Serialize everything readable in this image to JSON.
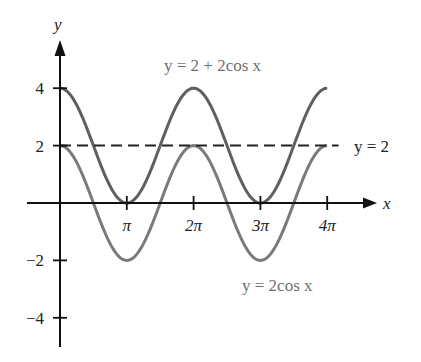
{
  "chart_data": {
    "type": "line",
    "title": "",
    "xlabel": "x",
    "ylabel": "y",
    "xlim": [
      -1.55,
      4.8
    ],
    "ylim": [
      -4.9,
      5.6
    ],
    "x_unit": "pi",
    "x_ticks": [
      {
        "value": 1,
        "label": "π"
      },
      {
        "value": 2,
        "label": "2π"
      },
      {
        "value": 3,
        "label": "3π"
      },
      {
        "value": 4,
        "label": "4π"
      }
    ],
    "y_ticks": [
      {
        "value": 4,
        "label": "4"
      },
      {
        "value": 2,
        "label": "2"
      },
      {
        "value": -2,
        "label": "−2"
      },
      {
        "value": -4,
        "label": "−4"
      }
    ],
    "grid": false,
    "series": [
      {
        "name": "y = 2 + 2cos x",
        "formula": "2 + 2cos(x)",
        "style": "solid",
        "color": "#5f5f5f",
        "domain_pi": [
          0,
          4
        ],
        "x_pi": [
          0,
          0.5,
          1,
          1.5,
          2,
          2.5,
          3,
          3.5,
          4
        ],
        "values": [
          4,
          2,
          0,
          2,
          4,
          2,
          0,
          2,
          4
        ]
      },
      {
        "name": "y = 2cos x",
        "formula": "2cos(x)",
        "style": "solid",
        "color": "#7a7a7a",
        "domain_pi": [
          0,
          4
        ],
        "x_pi": [
          0,
          0.5,
          1,
          1.5,
          2,
          2.5,
          3,
          3.5,
          4
        ],
        "values": [
          2,
          0,
          -2,
          0,
          2,
          0,
          -2,
          0,
          2
        ]
      },
      {
        "name": "y = 2",
        "formula": "2",
        "style": "dashed",
        "color": "#222222",
        "domain_pi": [
          0,
          4.17
        ],
        "values": [
          2,
          2
        ]
      }
    ],
    "annotations": [
      {
        "text": "y = 2 + 2cos x",
        "position": "top-center"
      },
      {
        "text": "y = 2",
        "position": "right, at y=2"
      },
      {
        "text": "y = 2cos x",
        "position": "bottom-right"
      }
    ]
  },
  "labels": {
    "x_axis": "x",
    "y_axis": "y",
    "top_curve": "y = 2 + 2cos x",
    "dashed_line": "y = 2",
    "bottom_curve": "y = 2cos x"
  }
}
